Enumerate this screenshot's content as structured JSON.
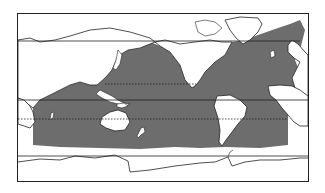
{
  "map": {
    "projection": "pacific-centered world map",
    "frame": {
      "x": 17,
      "y": 13,
      "width": 292,
      "height": 169
    },
    "colors": {
      "background": "#ffffff",
      "land": "#ffffff",
      "shaded_ocean": "#6d6d6d",
      "outline": "#222222"
    },
    "lines": {
      "north_limit_y": 41,
      "tropic_north_y": 84,
      "equator_y": 100,
      "tropic_south_y": 119,
      "south_limit_y": 156
    },
    "shaded_region": "ocean band between approx. 50N and 50S",
    "labels": []
  }
}
